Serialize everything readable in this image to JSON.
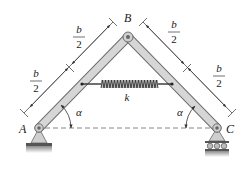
{
  "diagram": {
    "title": "",
    "points": {
      "A": {
        "label": "A",
        "x": 39,
        "y": 128
      },
      "B": {
        "label": "B",
        "x": 128,
        "y": 37
      },
      "C": {
        "label": "C",
        "x": 217,
        "y": 128
      }
    },
    "members": [
      {
        "id": "AB",
        "from": "A",
        "to": "B"
      },
      {
        "id": "BC",
        "from": "B",
        "to": "C"
      }
    ],
    "spring": {
      "label": "k"
    },
    "angles": [
      {
        "at": "A",
        "label": "α"
      },
      {
        "at": "C",
        "label": "α"
      }
    ],
    "dimensions": {
      "left_upper": {
        "num": "b",
        "den": "2"
      },
      "left_lower": {
        "num": "b",
        "den": "2"
      },
      "right_upper": {
        "num": "b",
        "den": "2"
      },
      "right_lower": {
        "num": "b",
        "den": "2"
      }
    },
    "supports": {
      "A": "pin-support",
      "C": "roller-support"
    },
    "colors": {
      "member_fill": "#d6d6d6",
      "member_stroke": "#6e6e6e",
      "line": "#333333",
      "ground": "#9a9a9a"
    }
  }
}
